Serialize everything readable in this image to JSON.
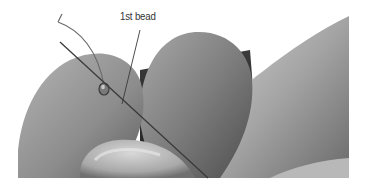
{
  "figure": {
    "callout": {
      "label": "1st bead"
    },
    "colors": {
      "background": "#ffffff",
      "skin_light": "#c8c8c8",
      "skin_mid": "#a0a0a0",
      "skin_dark": "#5a5a5a",
      "needle": "#3a3a3a",
      "label_text": "#333333"
    }
  }
}
